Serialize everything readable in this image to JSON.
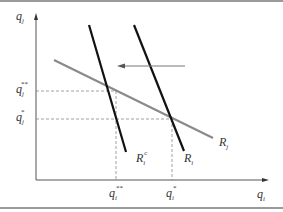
{
  "diagram": {
    "type": "reaction-functions",
    "axes": {
      "x": {
        "symbol": "q",
        "subscript": "i"
      },
      "y": {
        "symbol": "q",
        "subscript": "j"
      }
    },
    "curves": [
      {
        "id": "Rj",
        "name": "R",
        "subscript": "j",
        "superscript": "",
        "color": "#8a8a8a"
      },
      {
        "id": "Ric",
        "name": "R",
        "subscript": "i",
        "superscript": "c",
        "color": "#111111"
      },
      {
        "id": "Ri",
        "name": "R",
        "subscript": "i",
        "superscript": "",
        "color": "#111111"
      }
    ],
    "shift_arrow": {
      "direction": "left",
      "from": "Ri",
      "to": "Ric"
    },
    "equilibria": [
      {
        "id": "collusive-shift",
        "x_label": {
          "symbol": "q",
          "subscript": "i",
          "superscript": "**"
        },
        "y_label": {
          "symbol": "q",
          "subscript": "j",
          "superscript": "**"
        }
      },
      {
        "id": "original",
        "x_label": {
          "symbol": "q",
          "subscript": "i",
          "superscript": "*"
        },
        "y_label": {
          "symbol": "q",
          "subscript": "j",
          "superscript": "*"
        }
      }
    ],
    "colors": {
      "frame": "#9a9a9a",
      "axis": "#555555",
      "dashed": "#888888",
      "arrow": "#777777"
    }
  }
}
